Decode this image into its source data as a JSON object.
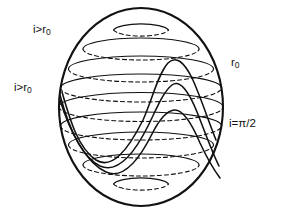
{
  "figure": {
    "name": "sphere-inclination-diagram",
    "background_color": "#ffffff",
    "line_color": "#111111",
    "type": "line-diagram"
  },
  "labels": {
    "top_left": {
      "id": "label-i-gt-r0-top",
      "text": "i>r₀",
      "base": "i>r",
      "sub": "0",
      "x": 33,
      "y": 30
    },
    "mid_left": {
      "id": "label-i-gt-r0-mid",
      "text": "i>r₀",
      "base": "i>r",
      "sub": "0",
      "x": 14,
      "y": 88
    },
    "top_right": {
      "id": "label-r0",
      "text": "r₀",
      "base": "r",
      "sub": "0",
      "x": 231,
      "y": 63
    },
    "bottom_right": {
      "id": "label-i-eq-pi-over-2",
      "text": "i=π/2",
      "base": "i=π/2",
      "sub": "",
      "x": 231,
      "y": 124
    }
  },
  "sphere": {
    "center_x": 141,
    "center_y": 107,
    "radius_x": 82,
    "radius_y": 99,
    "outline_stroke_width": 2.1
  },
  "latitudes": {
    "count": 8,
    "front_style": "solid",
    "back_style": "dashed",
    "dash_pattern": "4 3",
    "stroke_width": 1.1,
    "offsets": [
      -77,
      -58,
      -38,
      -19,
      0,
      19,
      38,
      58,
      77
    ]
  },
  "orbits": {
    "count": 3,
    "stroke_width": 1.5,
    "description": "three great circles of decreasing inclination crossing at nodes",
    "items": [
      {
        "id": "orbit-high-inclination",
        "peak_y": 62,
        "trough_y": 152,
        "amplitude": 45
      },
      {
        "id": "orbit-mid-inclination",
        "peak_y": 85,
        "trough_y": 163,
        "amplitude": 33
      },
      {
        "id": "orbit-low-inclination",
        "peak_y": 110,
        "trough_y": 173,
        "amplitude": 22
      }
    ]
  }
}
